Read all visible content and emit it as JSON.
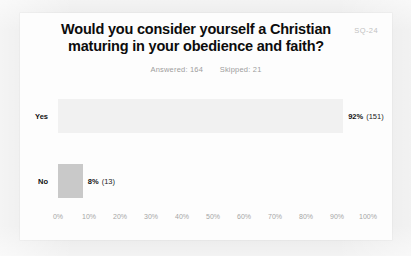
{
  "card": {
    "watermark": "SQ-24"
  },
  "chart_data": {
    "type": "bar",
    "orientation": "horizontal",
    "title_lines": [
      "Would you consider yourself a Christian",
      "maturing in your obedience and faith?"
    ],
    "title": "Would you consider yourself a Christian maturing in your obedience and faith?",
    "answered_label": "Answered: 164",
    "skipped_label": "Skipped: 21",
    "answered": 164,
    "skipped": 21,
    "categories": [
      "Yes",
      "No"
    ],
    "values": [
      92,
      8
    ],
    "counts": [
      151,
      13
    ],
    "value_labels": [
      "92%",
      "8%"
    ],
    "count_labels": [
      "(151)",
      "(13)"
    ],
    "bar_colors": [
      "#f1f1f1",
      "#c9c9c9"
    ],
    "xlabel": "",
    "ylabel": "",
    "xlim": [
      0,
      100
    ],
    "grid": false,
    "legend": "none",
    "tick_labels": [
      "0%",
      "10%",
      "20%",
      "30%",
      "40%",
      "50%",
      "60%",
      "70%",
      "80%",
      "90%",
      "100%"
    ],
    "tick_values": [
      0,
      10,
      20,
      30,
      40,
      50,
      60,
      70,
      80,
      90,
      100
    ]
  }
}
